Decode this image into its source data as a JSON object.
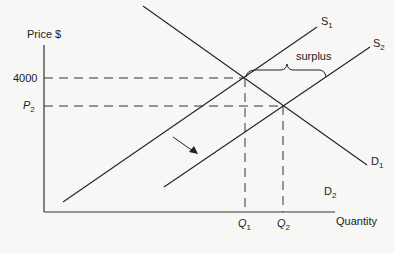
{
  "diagram": {
    "type": "supply-demand",
    "y_axis_label": "Price $",
    "x_axis_label": "Quantity",
    "price_ticks": [
      {
        "label": "4000"
      },
      {
        "label_main": "P",
        "label_sub": "2"
      }
    ],
    "quantity_ticks": [
      {
        "label_main": "Q",
        "label_sub": "1"
      },
      {
        "label_main": "Q",
        "label_sub": "2"
      }
    ],
    "curves": {
      "s1": {
        "main": "S",
        "sub": "1"
      },
      "s2": {
        "main": "S",
        "sub": "2"
      },
      "d1": {
        "main": "D",
        "sub": "1"
      },
      "d2": {
        "main": "D",
        "sub": "2"
      }
    },
    "annotation": "surplus",
    "colors": {
      "line": "#222222",
      "background": "#f7f7f6"
    }
  }
}
